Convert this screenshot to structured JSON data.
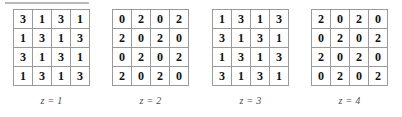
{
  "figure": {
    "title_rule": "",
    "grid_rows": 4,
    "grid_cols": 4,
    "panels": [
      {
        "caption": "z = 1",
        "rows": [
          [
            "3",
            "1",
            "3",
            "1"
          ],
          [
            "1",
            "3",
            "1",
            "3"
          ],
          [
            "3",
            "1",
            "3",
            "1"
          ],
          [
            "1",
            "3",
            "1",
            "3"
          ]
        ]
      },
      {
        "caption": "z = 2",
        "rows": [
          [
            "0",
            "2",
            "0",
            "2"
          ],
          [
            "2",
            "0",
            "2",
            "0"
          ],
          [
            "0",
            "2",
            "0",
            "2"
          ],
          [
            "2",
            "0",
            "2",
            "0"
          ]
        ]
      },
      {
        "caption": "z = 3",
        "rows": [
          [
            "1",
            "3",
            "1",
            "3"
          ],
          [
            "3",
            "1",
            "3",
            "1"
          ],
          [
            "1",
            "3",
            "1",
            "3"
          ],
          [
            "3",
            "1",
            "3",
            "1"
          ]
        ]
      },
      {
        "caption": "z = 4",
        "rows": [
          [
            "2",
            "0",
            "2",
            "0"
          ],
          [
            "0",
            "2",
            "0",
            "2"
          ],
          [
            "2",
            "0",
            "2",
            "0"
          ],
          [
            "0",
            "2",
            "0",
            "2"
          ]
        ]
      }
    ]
  },
  "colors": {
    "cell_border": "#9a9a9a",
    "outer_border": "#777777",
    "digit": "#111111",
    "caption": "#4a4a4a",
    "rule": "#b9b9b9",
    "background": "#ffffff"
  }
}
